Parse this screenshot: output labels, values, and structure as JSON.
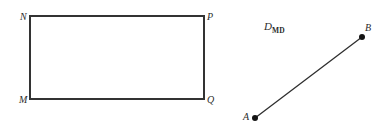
{
  "page": {
    "width": 388,
    "height": 136,
    "background_color": "#ffffff",
    "stroke_color": "#333333",
    "text_color": "#2b2b2b"
  },
  "figures": {
    "rectangle_figure": {
      "name": "rectangle MNPQ",
      "rect": {
        "x": 30,
        "y": 16,
        "width": 174,
        "height": 83
      },
      "stroke_width": 1.4,
      "vertices": [
        {
          "id": "N",
          "label": "N",
          "corner": "top-left",
          "x": 30,
          "y": 16,
          "label_x": 20,
          "label_y": 12
        },
        {
          "id": "P",
          "label": "P",
          "corner": "top-right",
          "x": 204,
          "y": 16,
          "label_x": 207,
          "label_y": 12
        },
        {
          "id": "M",
          "label": "M",
          "corner": "bottom-left",
          "x": 30,
          "y": 99,
          "label_x": 19,
          "label_y": 95
        },
        {
          "id": "Q",
          "label": "Q",
          "corner": "bottom-right",
          "x": 204,
          "y": 99,
          "label_x": 207,
          "label_y": 95
        }
      ]
    },
    "segment_figure": {
      "name": "segment AB",
      "caption": {
        "base": "D",
        "subscript": "MD",
        "x": 264,
        "y": 21
      },
      "stroke_width": 1.3,
      "dot_radius": 3.0,
      "endpoints": [
        {
          "id": "A",
          "label": "A",
          "x": 255,
          "y": 118,
          "label_x": 243,
          "label_y": 112
        },
        {
          "id": "B",
          "label": "B",
          "x": 362,
          "y": 37,
          "label_x": 365,
          "label_y": 23
        }
      ]
    }
  }
}
